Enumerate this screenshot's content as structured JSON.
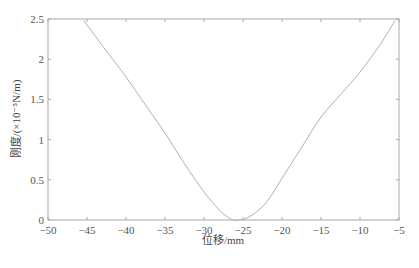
{
  "chart_data": {
    "type": "line",
    "title": "",
    "xlabel": "位移/mm",
    "ylabel": "刚度/(×10⁻⁵N/m)",
    "xlim": [
      -50,
      -5
    ],
    "ylim": [
      0,
      2.5
    ],
    "xticks": [
      -50,
      -45,
      -40,
      -35,
      -30,
      -25,
      -20,
      -15,
      -10,
      -5
    ],
    "yticks": [
      0,
      0.5,
      1,
      1.5,
      2,
      2.5
    ],
    "xtick_labels": [
      "−50",
      "−45",
      "−40",
      "−35",
      "−30",
      "−25",
      "−20",
      "−15",
      "−10",
      "−5"
    ],
    "ytick_labels": [
      "0",
      "0.5",
      "1",
      "1.5",
      "2",
      "2.5"
    ],
    "grid": false,
    "legend": null,
    "series": [
      {
        "name": "刚度",
        "color": "#b0b0b0",
        "x": [
          -45.4,
          -42.5,
          -40,
          -37.5,
          -35,
          -32.5,
          -30,
          -28,
          -26.5,
          -25.5,
          -24,
          -22,
          -20,
          -17.5,
          -15,
          -12.5,
          -10,
          -7.5,
          -5.5
        ],
        "y": [
          2.48,
          2.1,
          1.78,
          1.43,
          1.08,
          0.7,
          0.35,
          0.12,
          0.01,
          0.0,
          0.05,
          0.22,
          0.52,
          0.9,
          1.28,
          1.56,
          1.84,
          2.17,
          2.48
        ]
      }
    ]
  },
  "colors": {
    "axis": "#a8a8a8",
    "line": "#b0b0b0",
    "text": "#555555"
  }
}
